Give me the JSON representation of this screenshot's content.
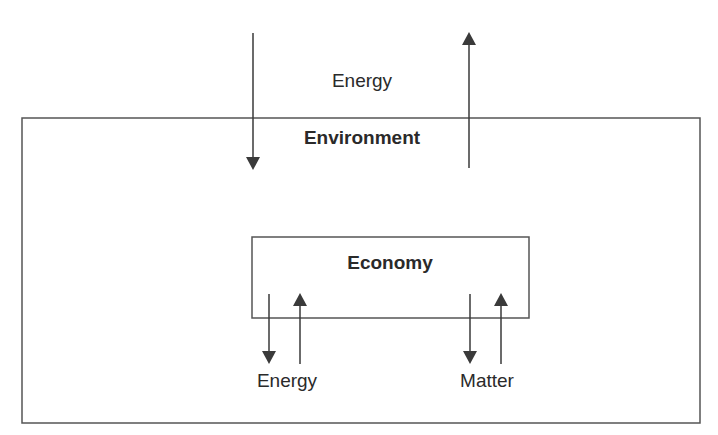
{
  "diagram": {
    "outer_box": {
      "label": "Environment"
    },
    "inner_box": {
      "label": "Economy"
    },
    "top_flow_label": "Energy",
    "bottom_flows": [
      {
        "label": "Energy"
      },
      {
        "label": "Matter"
      }
    ],
    "colors": {
      "line": "#3a3a3a",
      "text": "#2a2a2a",
      "background": "#ffffff"
    }
  }
}
